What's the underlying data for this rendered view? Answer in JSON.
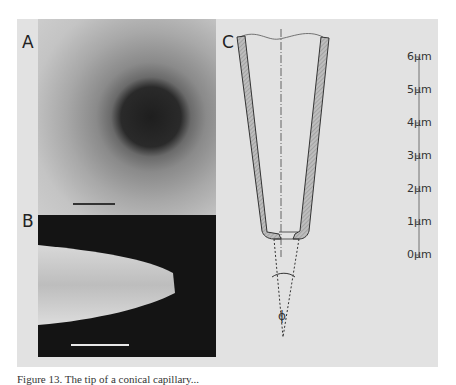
{
  "figure": {
    "panels": [
      {
        "label": "A",
        "type": "micrograph",
        "description": "tip aperture top view"
      },
      {
        "label": "B",
        "type": "micrograph",
        "description": "tip side view"
      },
      {
        "label": "C",
        "type": "schematic",
        "description": "conical tip cross-section"
      }
    ],
    "scale_axis": {
      "ticks": [
        "6µm",
        "5µm",
        "4µm",
        "3µm",
        "2µm",
        "1µm",
        "0µm"
      ]
    },
    "angle_symbol": "ϕ",
    "caption": "Figure 13. The tip of a conical capillary..."
  }
}
